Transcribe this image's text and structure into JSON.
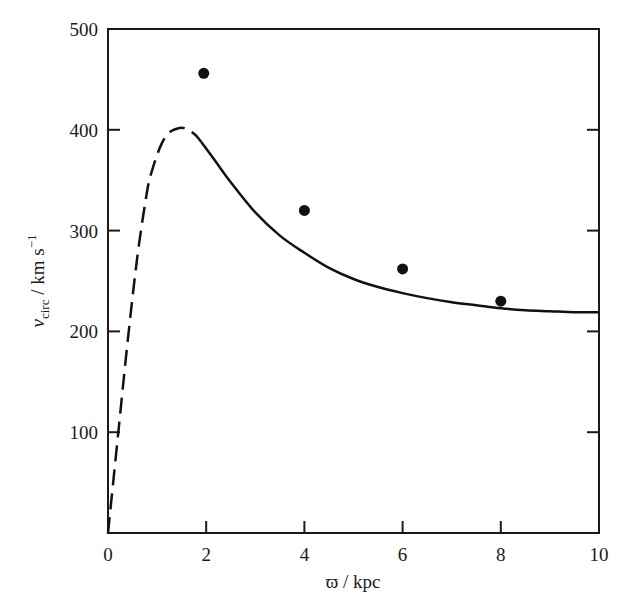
{
  "chart_data": {
    "type": "line",
    "title": "",
    "xlabel": "ϖ / kpc",
    "ylabel_main": "v",
    "ylabel_sub": "circ",
    "ylabel_units": " / km s",
    "ylabel_sup": "−1",
    "xlim": [
      0,
      10
    ],
    "ylim": [
      0,
      500
    ],
    "x_ticks": [
      0,
      2,
      4,
      6,
      8,
      10
    ],
    "x_tick_labels": [
      "0",
      "2",
      "4",
      "6",
      "8",
      "10"
    ],
    "y_ticks": [
      100,
      200,
      300,
      400,
      500
    ],
    "y_tick_labels": [
      "100",
      "200",
      "300",
      "400",
      "500"
    ],
    "grid": false,
    "series": [
      {
        "name": "model rotation curve (inner, dashed)",
        "style": "dashed",
        "x": [
          0,
          0.2,
          0.4,
          0.6,
          0.8,
          0.9,
          1.0,
          1.1,
          1.2,
          1.3,
          1.4,
          1.5,
          1.6,
          1.7,
          1.8,
          1.9
        ],
        "y": [
          0,
          95,
          190,
          275,
          340,
          360,
          375,
          387,
          395,
          399,
          401,
          402,
          401,
          398,
          394,
          388
        ]
      },
      {
        "name": "model rotation curve (solid)",
        "style": "solid",
        "x": [
          1.9,
          2.2,
          2.5,
          3.0,
          3.5,
          4.0,
          4.5,
          5.0,
          5.5,
          6.0,
          6.5,
          7.0,
          7.5,
          8.0,
          8.5,
          9.0,
          9.5,
          10.0
        ],
        "y": [
          388,
          368,
          348,
          318,
          295,
          278,
          263,
          252,
          244,
          238,
          233,
          229,
          226,
          223,
          221,
          220,
          219,
          219
        ]
      },
      {
        "name": "observed points",
        "style": "markers",
        "x": [
          1.95,
          4.0,
          6.0,
          8.0
        ],
        "y": [
          456,
          320,
          262,
          230
        ]
      }
    ]
  }
}
